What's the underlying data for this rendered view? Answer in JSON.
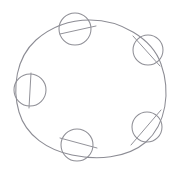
{
  "figure": {
    "background_color": "#ffffff",
    "stroke_color": "#8c8c94",
    "node_stroke_color": "#8f8f96",
    "canvas": {
      "width": 176,
      "height": 174
    }
  },
  "main_circle": {
    "name": "large-ring",
    "center_x": 90,
    "center_y": 88,
    "radius_x": 73,
    "radius_y": 68,
    "path": "M 90 20 C 120 20 152 38 161 64 C 171 92 166 124 146 142 C 126 159 96 160 72 155 C 48 150 26 136 19 112 C 12 88 16 58 36 40 C 52 26 72 20 90 20 Z"
  },
  "nodes": [
    {
      "id": "node-top",
      "label": "top",
      "center_x": 75,
      "center_y": 29,
      "radius": 16,
      "tick": {
        "x1": 60,
        "y1": 34,
        "x2": 96,
        "y2": 26
      }
    },
    {
      "id": "node-upper-right",
      "label": "upper-right",
      "center_x": 148,
      "center_y": 50,
      "radius": 15,
      "tick": {
        "x1": 133,
        "y1": 36,
        "x2": 160,
        "y2": 66
      }
    },
    {
      "id": "node-left",
      "label": "left",
      "center_x": 30,
      "center_y": 90,
      "radius": 16,
      "tick": {
        "x1": 31,
        "y1": 73,
        "x2": 29,
        "y2": 108
      }
    },
    {
      "id": "node-lower-right",
      "label": "lower-right",
      "center_x": 147,
      "center_y": 127,
      "radius": 15,
      "tick": {
        "x1": 161,
        "y1": 110,
        "x2": 131,
        "y2": 145
      }
    },
    {
      "id": "node-bottom",
      "label": "bottom",
      "center_x": 77,
      "center_y": 145,
      "radius": 16,
      "tick": {
        "x1": 60,
        "y1": 138,
        "x2": 97,
        "y2": 148
      }
    }
  ]
}
